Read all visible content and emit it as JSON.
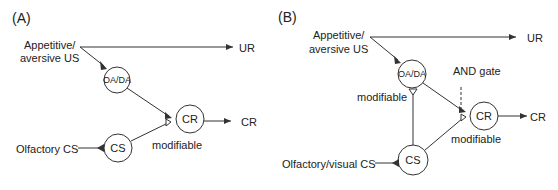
{
  "colors": {
    "stroke": "#333333",
    "text": "#222222",
    "background": "#ffffff"
  },
  "panel_a": {
    "label": "(A)",
    "us_line1": "Appetitive/",
    "us_line2": "aversive US",
    "ur": "UR",
    "oada": "OA/DA",
    "cr_node": "CR",
    "cr_out": "CR",
    "cs_node": "CS",
    "cs_input": "Olfactory CS",
    "modifiable": "modifiable"
  },
  "panel_b": {
    "label": "(B)",
    "us_line1": "Appetitive/",
    "us_line2": "aversive US",
    "ur": "UR",
    "oada": "OA/DA",
    "and_gate": "AND gate",
    "modifiable_oada": "modifiable",
    "cr_node": "CR",
    "cr_out": "CR",
    "modifiable_cr": "modifiable",
    "cs_node": "CS",
    "cs_input": "Olfactory/visual CS"
  }
}
